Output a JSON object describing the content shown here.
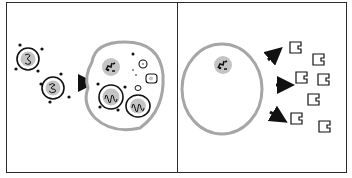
{
  "diagram": {
    "panels": [
      {
        "id": "left",
        "label": "Engulfment",
        "elements": [
          "small-cell-1",
          "small-cell-2",
          "arrow-into-cell",
          "large-cell-with-engulfed-cells"
        ]
      },
      {
        "id": "right",
        "label": "Release",
        "elements": [
          "large-cell-nucleus",
          "release-arrows",
          "released-particles"
        ]
      }
    ],
    "colors": {
      "outline": "#1a1a1a",
      "membrane": "#a8a8a8",
      "nucleus": "#c2c2c2",
      "background": "#ffffff"
    }
  }
}
